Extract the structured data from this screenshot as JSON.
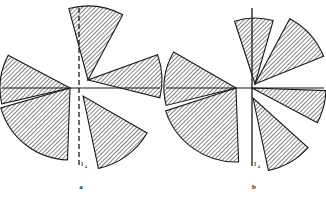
{
  "figure": {
    "background_color": "#ffffff",
    "ink_color": "#1a1a1a",
    "hatch_color": "#2b2b2b",
    "panels": [
      {
        "id": "a",
        "caption": "a",
        "center": {
          "x": 82,
          "y": 88
        },
        "radius": 74,
        "horizontal_axis": {
          "style": "solid",
          "x1": 2,
          "x2": 160,
          "y": 88
        },
        "vertical_axis": {
          "style": "dashed",
          "x": 79,
          "y1": 8,
          "y2": 166,
          "label": "I",
          "label_subscript": "4",
          "label_x": 81,
          "label_y": 166
        },
        "sectors": [
          {
            "name": "sector-north",
            "start_deg": 62,
            "end_deg": 105,
            "radius": 74,
            "apex_x": 88,
            "apex_y": 80,
            "hatch": "diag-right"
          },
          {
            "name": "sector-northwest",
            "start_deg": 152,
            "end_deg": 193,
            "radius": 70,
            "apex_x": 70,
            "apex_y": 88,
            "hatch": "diag-right"
          },
          {
            "name": "sector-east",
            "start_deg": 346,
            "end_deg": 20,
            "radius": 74,
            "apex_x": 88,
            "apex_y": 80,
            "hatch": "diag-right"
          },
          {
            "name": "sector-southeast",
            "start_deg": 282,
            "end_deg": 330,
            "radius": 74,
            "apex_x": 83,
            "apex_y": 96,
            "hatch": "diag-right"
          },
          {
            "name": "sector-southwest",
            "start_deg": 196,
            "end_deg": 268,
            "radius": 72,
            "apex_x": 70,
            "apex_y": 88,
            "hatch": "diag-right"
          }
        ]
      },
      {
        "id": "b",
        "caption": "b",
        "center": {
          "x": 245,
          "y": 88
        },
        "radius": 74,
        "horizontal_axis": {
          "style": "solid",
          "x1": 166,
          "x2": 324,
          "y": 88
        },
        "vertical_axis": {
          "style": "solid",
          "x": 252,
          "y1": 8,
          "y2": 166,
          "label": "I",
          "label_subscript": "4",
          "label_x": 254,
          "label_y": 166
        },
        "sectors": [
          {
            "name": "sector-north",
            "start_deg": 74,
            "end_deg": 108,
            "radius": 66,
            "apex_x": 255,
            "apex_y": 84,
            "hatch": "diag-right"
          },
          {
            "name": "sector-northeast",
            "start_deg": 22,
            "end_deg": 62,
            "radius": 74,
            "apex_x": 255,
            "apex_y": 84,
            "hatch": "diag-right"
          },
          {
            "name": "sector-east",
            "start_deg": 332,
            "end_deg": 358,
            "radius": 74,
            "apex_x": 252,
            "apex_y": 88,
            "hatch": "diag-right"
          },
          {
            "name": "sector-northwest",
            "start_deg": 150,
            "end_deg": 194,
            "radius": 72,
            "apex_x": 236,
            "apex_y": 88,
            "hatch": "diag-right"
          },
          {
            "name": "sector-southwest",
            "start_deg": 198,
            "end_deg": 272,
            "radius": 74,
            "apex_x": 236,
            "apex_y": 88,
            "hatch": "diag-right"
          },
          {
            "name": "sector-south",
            "start_deg": 282,
            "end_deg": 318,
            "radius": 74,
            "apex_x": 253,
            "apex_y": 98,
            "hatch": "diag-right"
          }
        ]
      }
    ]
  }
}
